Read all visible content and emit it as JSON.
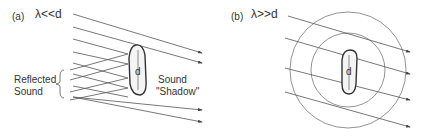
{
  "panel_a": {
    "label": "(a)",
    "condition": "λ<<d",
    "object_label": "d",
    "reflected_label_line1": "Reflected",
    "reflected_label_line2": "Sound",
    "shadow_label_line1": "Sound",
    "shadow_label_line2": "\"Shadow\""
  },
  "panel_b": {
    "label": "(b)",
    "condition": "λ>>d",
    "object_label": "d"
  },
  "colors": {
    "line": "#555555",
    "text": "#333333"
  }
}
